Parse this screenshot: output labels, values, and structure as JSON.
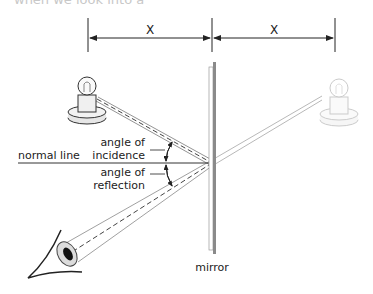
{
  "header": {
    "clipped_text": "when we look into a"
  },
  "dimensions": {
    "left_label": "X",
    "right_label": "X"
  },
  "labels": {
    "normal_line": "normal line",
    "incidence_line1": "angle of",
    "incidence_line2": "incidence",
    "reflection_line1": "angle of",
    "reflection_line2": "reflection",
    "mirror": "mirror"
  },
  "objects": {
    "real_bulb": "light-bulb (object)",
    "virtual_bulb": "light-bulb (virtual image)",
    "eye": "observer eye"
  },
  "colors": {
    "ink": "#222222",
    "ray": "#555555",
    "mirror": "#888888",
    "image": "#bdbdbd"
  }
}
